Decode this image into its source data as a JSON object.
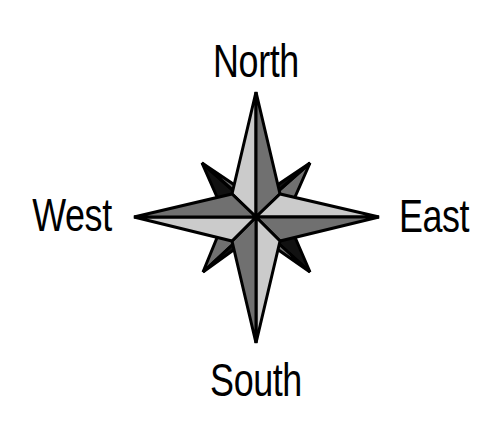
{
  "labels": {
    "north": "North",
    "south": "South",
    "east": "East",
    "west": "West"
  },
  "colors": {
    "light": "#cbcbcb",
    "dark": "#707070",
    "shadow": "#111111",
    "outline": "#000000",
    "background": "#ffffff"
  },
  "geometry": {
    "center": [
      256,
      217
    ],
    "north_tip": [
      256,
      92
    ],
    "south_tip": [
      256,
      343
    ],
    "east_tip": [
      379,
      217
    ],
    "west_tip": [
      134,
      217
    ],
    "ne_tip": [
      310,
      163
    ],
    "nw_tip": [
      202,
      163
    ],
    "se_tip": [
      310,
      272
    ],
    "sw_tip": [
      203,
      272
    ]
  }
}
